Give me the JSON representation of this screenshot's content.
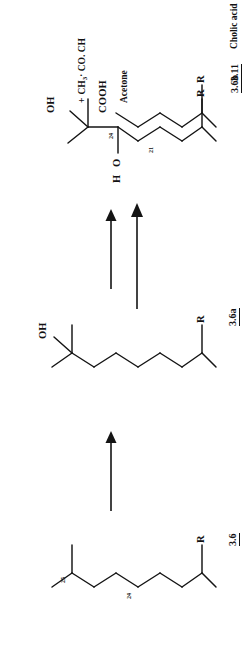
{
  "document": {
    "kind": "chemical-reaction-scheme",
    "orientation": "rotated-90-ccw"
  },
  "structures": [
    {
      "id": "3.6",
      "id_label": "3.6",
      "name": "",
      "atom_labels": [
        "R"
      ],
      "carbon_numbers": [
        "24",
        "25"
      ],
      "substituents": []
    },
    {
      "id": "3.6a",
      "id_label": "3.6a",
      "name": "",
      "atom_labels": [
        "OH",
        "R"
      ],
      "carbon_numbers": [],
      "substituents": [
        "OH"
      ]
    },
    {
      "id": "3.6b",
      "id_label": "3.6b",
      "name": "",
      "atom_labels": [
        "OH",
        "H",
        "O",
        "R"
      ],
      "carbon_numbers": [
        "24",
        "21"
      ],
      "substituents": [
        "OH",
        "H-O"
      ]
    },
    {
      "id": "3.11",
      "id_label": "3.11",
      "name": "Cholic acid",
      "atom_labels": [
        "COOH",
        "R"
      ],
      "carbon_numbers": [],
      "substituents": [
        "COOH"
      ]
    }
  ],
  "byproduct": {
    "plus_sign": "+",
    "formula_parts": [
      "CH",
      "3",
      "· CO. CH"
    ],
    "formula_text": "+ CH3· CO. CH",
    "name": "Acetone"
  },
  "arrows": [
    {
      "name": "arrow-3-6-to-3-6a",
      "direction": "up"
    },
    {
      "name": "arrow-3-6a-to-3-6b",
      "direction": "up"
    },
    {
      "name": "arrow-3-6b-to-3-11",
      "direction": "right"
    }
  ],
  "atoms": {
    "oh": "OH",
    "h": "H",
    "o": "O",
    "r": "R",
    "cooh": "COOH"
  },
  "colors": {
    "ink": "#141414",
    "paper": "#ffffff"
  }
}
